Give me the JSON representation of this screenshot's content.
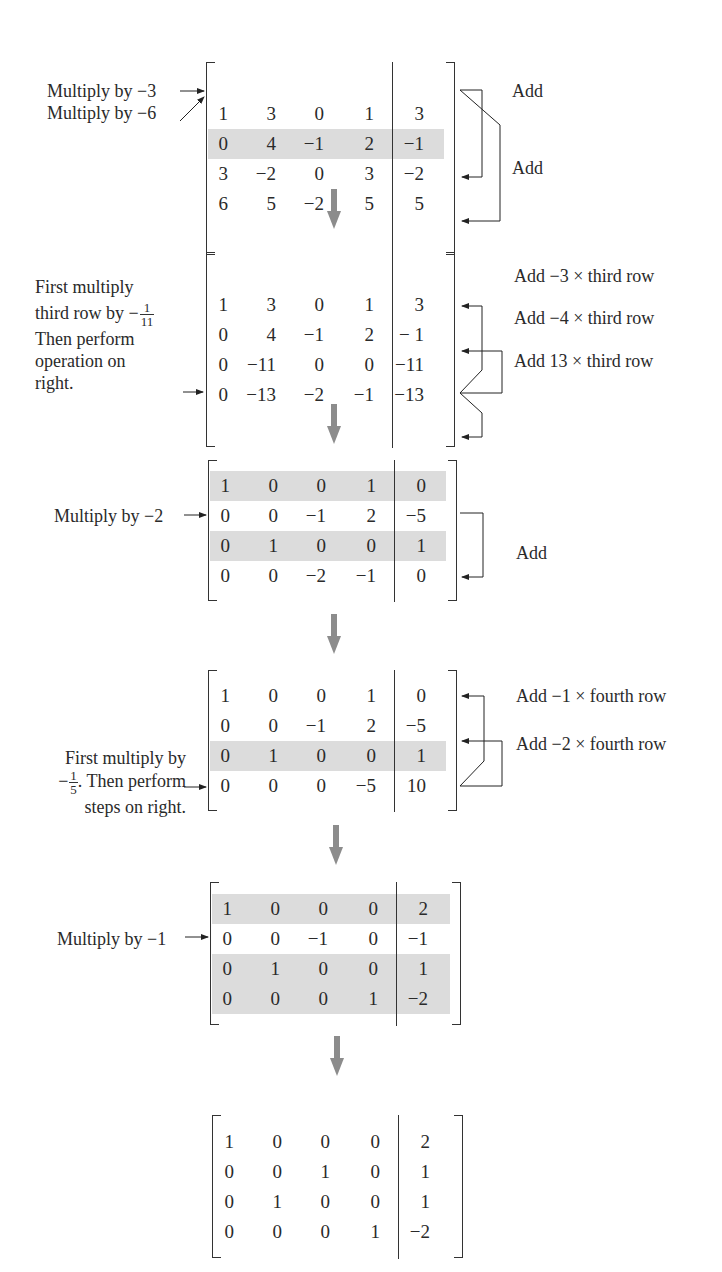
{
  "figure": {
    "accent_color": "#8c8c8c",
    "shade_color": "#dcdcdc",
    "steps": [
      {
        "id": "step1",
        "rows": [
          [
            "1",
            "3",
            "0",
            "1",
            "3"
          ],
          [
            "0",
            "4",
            "−1",
            "2",
            "−1"
          ],
          [
            "3",
            "−2",
            "0",
            "3",
            "−2"
          ],
          [
            "6",
            "5",
            "−2",
            "5",
            "5"
          ]
        ],
        "shaded_rows": [
          1
        ],
        "left_annotations": [
          "Multiply by −3",
          "Multiply by −6"
        ],
        "right_annotations": [
          "Add",
          "Add"
        ]
      },
      {
        "id": "step2",
        "rows": [
          [
            "1",
            "3",
            "0",
            "1",
            "3"
          ],
          [
            "0",
            "4",
            "−1",
            "2",
            "− 1"
          ],
          [
            "0",
            "−11",
            "0",
            "0",
            "−11"
          ],
          [
            "0",
            "−13",
            "−2",
            "−1",
            "−13"
          ]
        ],
        "shaded_rows": [],
        "left_annotation": {
          "line1": "First multiply",
          "line2_prefix": "third row by −",
          "fraction_num": "1",
          "fraction_den": "11",
          "line3": "Then perform",
          "line4": "operation on",
          "line5": "right."
        },
        "right_annotations": [
          "Add −3 × third row",
          "Add −4 × third row",
          "Add 13 × third row"
        ]
      },
      {
        "id": "step3",
        "rows": [
          [
            "1",
            "0",
            "0",
            "1",
            "0"
          ],
          [
            "0",
            "0",
            "−1",
            "2",
            "−5"
          ],
          [
            "0",
            "1",
            "0",
            "0",
            "1"
          ],
          [
            "0",
            "0",
            "−2",
            "−1",
            "0"
          ]
        ],
        "shaded_rows": [
          0,
          2
        ],
        "left_annotations": [
          "Multiply by −2"
        ],
        "right_annotations": [
          "Add"
        ]
      },
      {
        "id": "step4",
        "rows": [
          [
            "1",
            "0",
            "0",
            "1",
            "0"
          ],
          [
            "0",
            "0",
            "−1",
            "2",
            "−5"
          ],
          [
            "0",
            "1",
            "0",
            "0",
            "1"
          ],
          [
            "0",
            "0",
            "0",
            "−5",
            "10"
          ]
        ],
        "shaded_rows": [
          2
        ],
        "left_annotation": {
          "line1": "First multiply by",
          "line2_prefix": "−",
          "fraction_num": "1",
          "fraction_den": "5",
          "line2_suffix": ". Then perform",
          "line3": "steps on right."
        },
        "right_annotations": [
          "Add −1 × fourth row",
          "Add −2 × fourth row"
        ]
      },
      {
        "id": "step5",
        "rows": [
          [
            "1",
            "0",
            "0",
            "0",
            "2"
          ],
          [
            "0",
            "0",
            "−1",
            "0",
            "−1"
          ],
          [
            "0",
            "1",
            "0",
            "0",
            "1"
          ],
          [
            "0",
            "0",
            "0",
            "1",
            "−2"
          ]
        ],
        "shaded_rows": [
          0,
          2,
          3
        ],
        "left_annotations": [
          "Multiply by −1"
        ],
        "right_annotations": []
      },
      {
        "id": "step6",
        "rows": [
          [
            "1",
            "0",
            "0",
            "0",
            "2"
          ],
          [
            "0",
            "0",
            "1",
            "0",
            "1"
          ],
          [
            "0",
            "1",
            "0",
            "0",
            "1"
          ],
          [
            "0",
            "0",
            "0",
            "1",
            "−2"
          ]
        ],
        "shaded_rows": [],
        "left_annotations": [],
        "right_annotations": []
      }
    ]
  }
}
